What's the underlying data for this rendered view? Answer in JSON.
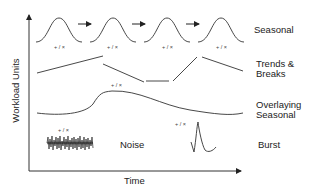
{
  "diagram": {
    "axes": {
      "y_label": "Workload Units",
      "x_label": "Time"
    },
    "components": [
      {
        "name": "seasonal",
        "label": "Seasonal"
      },
      {
        "name": "trends-breaks",
        "label": "Trends &\nBreaks"
      },
      {
        "name": "overlaying-seasonal",
        "label": "Overlaying\nSeasonal"
      },
      {
        "name": "noise",
        "label": "Noise"
      },
      {
        "name": "burst",
        "label": "Burst"
      }
    ],
    "operators": {
      "op1": "+ / ×",
      "op2": "+ / ×",
      "op3": "+ / ×",
      "op4": "+ / ×",
      "op5": "+ / ×",
      "op6": "+ / ×",
      "op7": "+ / ×"
    },
    "colors": {
      "stroke": "#333333",
      "text": "#222222"
    }
  }
}
